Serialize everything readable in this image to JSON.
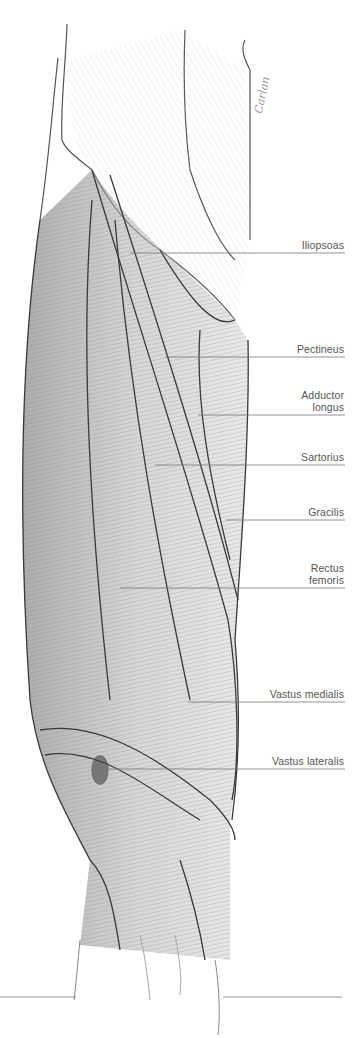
{
  "figure": {
    "signature": "Carlan",
    "colors": {
      "background": "#ffffff",
      "label_text": "#555555",
      "leader_line": "#777777",
      "sketch": "#3a3a3a"
    }
  },
  "labels": [
    {
      "text": "Iliopsoas",
      "line_y": 253,
      "line_x1": 130,
      "text_top": 239
    },
    {
      "text": "Pectineus",
      "line_y": 357,
      "line_x1": 165,
      "text_top": 343
    },
    {
      "text": "Adductor\nlongus",
      "line_y": 415,
      "line_x1": 198,
      "text_top": 389
    },
    {
      "text": "Sartorius",
      "line_y": 465,
      "line_x1": 155,
      "text_top": 451
    },
    {
      "text": "Gracilis",
      "line_y": 520,
      "line_x1": 226,
      "text_top": 506
    },
    {
      "text": "Rectus\nfemoris",
      "line_y": 588,
      "line_x1": 120,
      "text_top": 562
    },
    {
      "text": "Vastus medialis",
      "line_y": 702,
      "line_x1": 188,
      "text_top": 688
    },
    {
      "text": "Vastus lateralis",
      "line_y": 769,
      "line_x1": 96,
      "text_top": 755
    }
  ],
  "bottom_lines": [
    {
      "x1": 0,
      "x2": 76,
      "y": 997
    },
    {
      "x1": 223,
      "x2": 342,
      "y": 997
    }
  ]
}
